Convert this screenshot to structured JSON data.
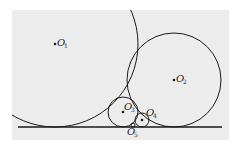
{
  "diagram": {
    "background_color": "#ececec",
    "stroke_color": "#1a1a1a",
    "circles": [
      {
        "id": "O1",
        "label": "O",
        "sub": "1"
      },
      {
        "id": "O2",
        "label": "O",
        "sub": "2"
      },
      {
        "id": "O3",
        "label": "O",
        "sub": "3"
      },
      {
        "id": "O4",
        "label": "O",
        "sub": "4"
      },
      {
        "id": "O5",
        "label": "O",
        "sub": "5"
      }
    ]
  }
}
